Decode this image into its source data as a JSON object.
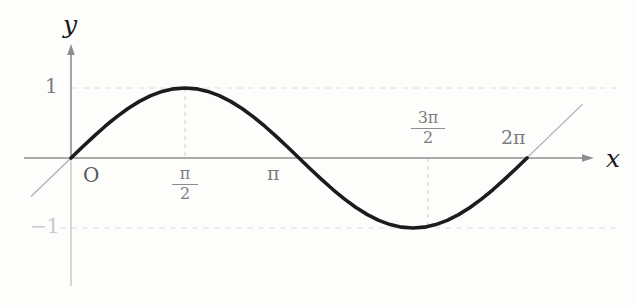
{
  "figure": {
    "background_color": "#fdfdfc",
    "curve_color": "#1c1c1c",
    "axis_color": "#8e8e8e",
    "grid_color": "#d8d8d8",
    "label_color": "#7d7d7d"
  },
  "axes": {
    "y_axis_label": "y",
    "x_axis_label": "x",
    "origin_label": "O"
  },
  "y_ticks": [
    {
      "label": "1",
      "value": 1
    },
    {
      "label": "−1",
      "value": -1
    }
  ],
  "x_ticks": [
    {
      "label": "π/2",
      "numerator": "π",
      "denominator": "2",
      "value": 1.5707963
    },
    {
      "label": "π",
      "numerator": "π",
      "denominator": "",
      "value": 3.1415927
    },
    {
      "label": "3π/2",
      "numerator": "3π",
      "denominator": "2",
      "value": 4.712389
    },
    {
      "label": "2π",
      "numerator": "2π",
      "denominator": "",
      "value": 6.2831853
    }
  ],
  "chart_data": {
    "type": "line",
    "title": "",
    "xlabel": "x",
    "ylabel": "y",
    "xlim": [
      -0.55,
      7.2
    ],
    "ylim": [
      -1.45,
      1.45
    ],
    "grid": true,
    "legend": null,
    "series": [
      {
        "name": "y = sin x",
        "color": "#1c1c1c",
        "x": [
          0,
          0.1571,
          0.3142,
          0.4712,
          0.6283,
          0.7854,
          0.9425,
          1.0996,
          1.2566,
          1.4137,
          1.5708,
          1.7279,
          1.885,
          2.042,
          2.1991,
          2.3562,
          2.5133,
          2.6704,
          2.8274,
          2.9845,
          3.1416,
          3.2987,
          3.4558,
          3.6128,
          3.7699,
          3.927,
          4.0841,
          4.2412,
          4.3982,
          4.5553,
          4.7124,
          4.8695,
          5.0265,
          5.1836,
          5.3407,
          5.4978,
          5.6549,
          5.8119,
          5.969,
          6.1261,
          6.2832
        ],
        "y": [
          0,
          0.1564,
          0.309,
          0.454,
          0.5878,
          0.7071,
          0.809,
          0.891,
          0.9511,
          0.9877,
          1,
          0.9877,
          0.9511,
          0.891,
          0.809,
          0.7071,
          0.5878,
          0.454,
          0.309,
          0.1564,
          0,
          -0.1564,
          -0.309,
          -0.454,
          -0.5878,
          -0.7071,
          -0.809,
          -0.891,
          -0.9511,
          -0.9877,
          -1,
          -0.9877,
          -0.9511,
          -0.891,
          -0.809,
          -0.7071,
          -0.5878,
          -0.454,
          -0.309,
          -0.1564,
          0
        ]
      },
      {
        "name": "tangent at x = 0",
        "color": "#b0b0b0",
        "x": [
          -0.55,
          0.55
        ],
        "y": [
          -0.55,
          0.55
        ]
      },
      {
        "name": "tangent at x = 2π",
        "color": "#b0b0b0",
        "x": [
          5.75,
          7.05
        ],
        "y": [
          -0.53,
          0.77
        ]
      }
    ],
    "gridlines_y": [
      1,
      -1
    ],
    "gridlines_x": [
      1.5707963,
      4.712389
    ],
    "annotations": [
      {
        "text": "O",
        "x": 0.22,
        "y": -0.24
      },
      {
        "text": "1",
        "x": -0.35,
        "y": 1.0
      },
      {
        "text": "−1",
        "x": -0.42,
        "y": -1.0
      },
      {
        "text": "y",
        "x": 0.02,
        "y": 1.65
      },
      {
        "text": "x",
        "x": 7.25,
        "y": -0.03
      },
      {
        "text": "π/2",
        "x": 1.5707963,
        "y": -0.32
      },
      {
        "text": "π",
        "x": 3.1415927,
        "y": -0.26
      },
      {
        "text": "3π/2",
        "x": 4.712389,
        "y": 0.36
      },
      {
        "text": "2π",
        "x": 6.2831853,
        "y": 0.28
      }
    ]
  }
}
